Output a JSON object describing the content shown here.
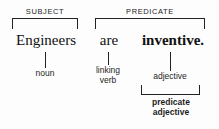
{
  "diagram": {
    "sentence": {
      "subject_word": "Engineers",
      "linking_word": "are",
      "predicate_word": "inventive."
    },
    "top_labels": {
      "subject": "SUBJECT",
      "predicate": "PREDICATE"
    },
    "part_labels": {
      "noun": "noun",
      "linking_verb_line1": "linking",
      "linking_verb_line2": "verb",
      "adjective": "adjective",
      "predicate_adjective_line1": "predicate",
      "predicate_adjective_line2": "adjective"
    },
    "colors": {
      "ink": "#1a1a1a",
      "rule": "#222222",
      "background": "#fdfdfd"
    }
  }
}
